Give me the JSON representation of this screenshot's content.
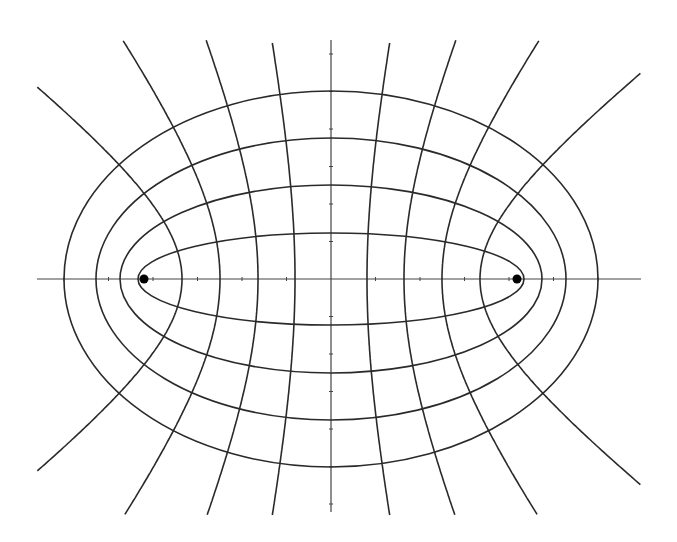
{
  "diagram": {
    "type": "confocal-elliptic-coordinates",
    "center": {
      "x": 331,
      "y": 279
    },
    "focal_distance": 187,
    "foci": [
      {
        "x": 144,
        "y": 279
      },
      {
        "x": 517,
        "y": 279
      }
    ],
    "ellipses": [
      {
        "a": 193,
        "b": 46
      },
      {
        "a": 211,
        "b": 94
      },
      {
        "a": 235,
        "b": 141
      },
      {
        "a": 267,
        "b": 188
      }
    ],
    "hyperbola_vertices": [
      36,
      73,
      111,
      149
    ],
    "axes": {
      "x_axis": {
        "x1": 37,
        "x2": 641,
        "y": 279
      },
      "y_axis": {
        "x": 331,
        "y1": 40,
        "y2": 512
      }
    },
    "curve_bounds": {
      "top": 40,
      "bottom": 516,
      "left": 37,
      "right": 641
    },
    "colors": {
      "line": "#2a2a2a",
      "axis": "#444444",
      "focus": "#000000",
      "background": "#ffffff"
    }
  }
}
